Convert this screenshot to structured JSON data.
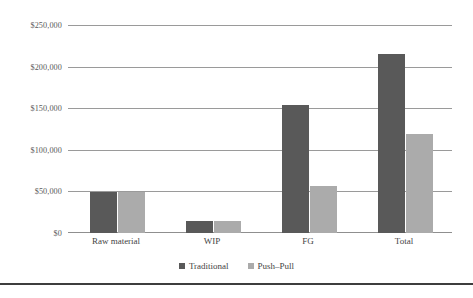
{
  "chart_data": {
    "type": "bar",
    "title": "",
    "subtitle": "",
    "xlabel": "",
    "ylabel": "",
    "categories": [
      "Raw material",
      "WIP",
      "FG",
      "Total"
    ],
    "series": [
      {
        "name": "Traditional",
        "color": "#595959",
        "values": [
          50000,
          15000,
          155000,
          216000
        ]
      },
      {
        "name": "Push–Pull",
        "color": "#ababab",
        "values": [
          50000,
          15000,
          57000,
          120000
        ]
      }
    ],
    "ylim": [
      0,
      250000
    ],
    "ytick_values": [
      0,
      50000,
      100000,
      150000,
      200000,
      250000
    ],
    "ytick_labels": [
      "$0",
      "$50,000",
      "$100,000",
      "$150,000",
      "$200,000",
      "$250,000"
    ],
    "grid": "horizontal",
    "legend_position": "bottom-center",
    "annotations": []
  },
  "legend": {
    "entries": [
      {
        "label": "Traditional",
        "color": "#595959"
      },
      {
        "label": "Push–Pull",
        "color": "#ababab"
      }
    ]
  },
  "axes": {
    "y_labels": [
      "$250,000",
      "$200,000",
      "$150,000",
      "$100,000",
      "$50,000",
      "$0"
    ],
    "x_labels": [
      "Raw material",
      "WIP",
      "FG",
      "Total"
    ]
  },
  "colors": {
    "traditional": "#595959",
    "pushpull": "#ababab",
    "gridline": "#9a9a9a",
    "text": "#444444",
    "ytext": "#5b5b5b",
    "rule": "#3d3d3d",
    "background": "#ffffff"
  }
}
